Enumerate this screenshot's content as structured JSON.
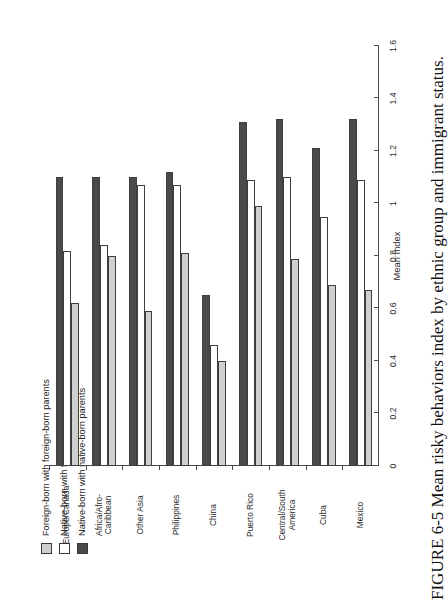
{
  "figure": {
    "caption": "FIGURE 6-5 Mean risky behaviors index by ethnic group and immigrant status."
  },
  "chart_data": {
    "type": "bar",
    "orientation": "horizontal",
    "title": "",
    "xlabel": "",
    "ylabel": "Mean Index",
    "value_axis_label": "Mean Index",
    "ylim": [
      0,
      1.6
    ],
    "tick_labels": [
      "0",
      "0.2",
      "0.4",
      "0.6",
      "0.8",
      "1",
      "1.2",
      "1.4",
      "1.6"
    ],
    "tick_values": [
      0,
      0.2,
      0.4,
      0.6,
      0.8,
      1.0,
      1.2,
      1.4,
      1.6
    ],
    "grid": false,
    "legend_position": "top-left",
    "categories": [
      "Mexico",
      "Cuba",
      "Central/South\nAmerica",
      "Puerto Rico",
      "China",
      "Philippines",
      "Other Asia",
      "Africa/Afro-\nCaribbean",
      "Europe/Canada"
    ],
    "series": [
      {
        "name": "Foreign-born with foreign-born parents",
        "color": "#cfcfcf",
        "values": [
          0.67,
          0.69,
          0.79,
          0.99,
          0.4,
          0.81,
          0.59,
          0.8,
          0.62
        ]
      },
      {
        "name": "Native-born with foreign-born parents",
        "color": "#ffffff",
        "values": [
          1.09,
          0.95,
          1.1,
          1.09,
          0.46,
          1.07,
          1.07,
          0.84,
          0.82
        ]
      },
      {
        "name": "Native-born with native-born parents",
        "color": "#4a4a4a",
        "values": [
          1.32,
          1.21,
          1.32,
          1.31,
          0.65,
          1.12,
          1.1,
          1.1,
          1.1
        ]
      }
    ]
  }
}
